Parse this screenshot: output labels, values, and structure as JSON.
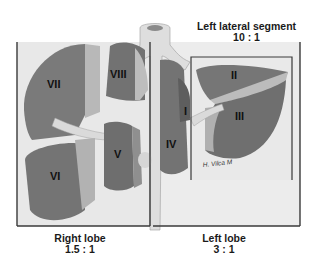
{
  "figure": {
    "captions": {
      "left_lateral_segment": {
        "label": "Left lateral segment",
        "ratio": "10 : 1"
      },
      "right_lobe": {
        "label": "Right lobe",
        "ratio": "1.5 : 1"
      },
      "left_lobe": {
        "label": "Left lobe",
        "ratio": "3 : 1"
      }
    },
    "segments": [
      "I",
      "II",
      "III",
      "IV",
      "V",
      "VI",
      "VII",
      "VIII"
    ],
    "segment_labels": {
      "I": "I",
      "II": "II",
      "III": "III",
      "IV": "IV",
      "V": "V",
      "VI": "VI",
      "VII": "VII",
      "VIII": "VIII"
    },
    "signature": "H. Vilca M",
    "colors": {
      "background": "#ffffff",
      "frame_fill": "#e6e6e6",
      "frame_line": "#3a3a3a",
      "liver_dark": "#6f6f6f",
      "liver_mid": "#8c8c8c",
      "liver_light": "#b5b5b5",
      "vessel": "#dcdcdc"
    }
  }
}
